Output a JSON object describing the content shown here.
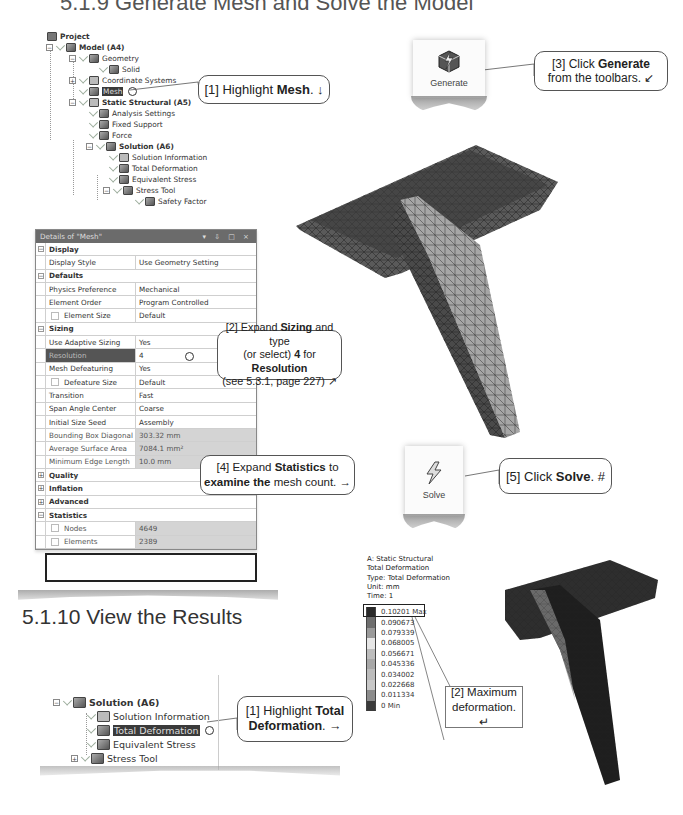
{
  "page_heading_partial": "5.1.9 Generate Mesh and Solve the Model",
  "tree": {
    "items": [
      {
        "label": "Project",
        "bold": true
      },
      {
        "label": "Model (A4)",
        "bold": true
      },
      {
        "label": "Geometry"
      },
      {
        "label": "Solid"
      },
      {
        "label": "Coordinate Systems"
      },
      {
        "label": "Mesh",
        "selected": true
      },
      {
        "label": "Static Structural (A5)",
        "bold": true
      },
      {
        "label": "Analysis Settings"
      },
      {
        "label": "Fixed Support"
      },
      {
        "label": "Force"
      },
      {
        "label": "Solution (A6)",
        "bold": true
      },
      {
        "label": "Solution Information"
      },
      {
        "label": "Total Deformation"
      },
      {
        "label": "Equivalent Stress"
      },
      {
        "label": "Stress Tool"
      },
      {
        "label": "Safety Factor"
      }
    ]
  },
  "callouts": {
    "c1": {
      "prefix": "[1] Highlight ",
      "bold": "Mesh",
      "suffix": ". ↓"
    },
    "c2": {
      "line1_pre": "[2] Expand ",
      "line1_bold": "Sizing",
      "line1_post": " and type",
      "line2_pre": "(or select) ",
      "line2_bold1": "4",
      "line2_mid": " for ",
      "line2_bold2": "Resolution",
      "line3": "(see 5.3.1, page 227) ↗"
    },
    "c3": {
      "line1_pre": "[3] Click ",
      "line1_bold": "Generate",
      "line2": "from the toolbars. ↙"
    },
    "c4": {
      "line1_pre": "[4] Expand ",
      "line1_bold": "Statistics",
      "line1_post": " to",
      "line2_bold": "examine the",
      "line2_post": " mesh count. →"
    },
    "c5": {
      "prefix": "[5] Click ",
      "bold": "Solve",
      "suffix": ". #"
    },
    "r1": {
      "line1_pre": "[1] Highlight ",
      "line1_bold": "Total",
      "line2_bold": "Deformation",
      "line2_post": ". →"
    },
    "r2": {
      "line1": "[2] Maximum",
      "line2": "deformation. ↵"
    }
  },
  "toolbar": {
    "generate_label": "Generate",
    "solve_label": "Solve"
  },
  "details": {
    "title": "Details of \"Mesh\"",
    "title_controls": "▾ ⇩ □ ×",
    "rows": [
      {
        "type": "group",
        "key": "Display",
        "toggle": "−"
      },
      {
        "key": "Display Style",
        "value": "Use Geometry Setting"
      },
      {
        "type": "group",
        "key": "Defaults",
        "toggle": "−"
      },
      {
        "key": "Physics Preference",
        "value": "Mechanical"
      },
      {
        "key": "Element Order",
        "value": "Program Controlled"
      },
      {
        "key": "Element Size",
        "value": "Default",
        "checkbox": true
      },
      {
        "type": "group",
        "key": "Sizing",
        "toggle": "−"
      },
      {
        "key": "Use Adaptive Sizing",
        "value": "Yes"
      },
      {
        "key": "Resolution",
        "value": "4",
        "selected": true
      },
      {
        "key": "Mesh Defeaturing",
        "value": "Yes"
      },
      {
        "key": "Defeature Size",
        "value": "Default",
        "checkbox": true
      },
      {
        "key": "Transition",
        "value": "Fast"
      },
      {
        "key": "Span Angle Center",
        "value": "Coarse"
      },
      {
        "key": "Initial Size Seed",
        "value": "Assembly"
      },
      {
        "key": "Bounding Box Diagonal",
        "value": "303.32 mm",
        "readonly": true
      },
      {
        "key": "Average Surface Area",
        "value": "7084.1 mm²",
        "readonly": true
      },
      {
        "key": "Minimum Edge Length",
        "value": "10.0 mm",
        "readonly": true
      },
      {
        "type": "group",
        "key": "Quality",
        "toggle": "+"
      },
      {
        "type": "group",
        "key": "Inflation",
        "toggle": "+"
      },
      {
        "type": "group",
        "key": "Advanced",
        "toggle": "+"
      },
      {
        "type": "group",
        "key": "Statistics",
        "toggle": "−"
      },
      {
        "key": "Nodes",
        "value": "4649",
        "checkbox": true,
        "readonly": true
      },
      {
        "key": "Elements",
        "value": "2389",
        "checkbox": true,
        "readonly": true
      }
    ]
  },
  "section": {
    "heading": "5.1.10 View the Results"
  },
  "results_tree": {
    "items": [
      {
        "label": "Solution (A6)",
        "bold": true
      },
      {
        "label": "Solution Information"
      },
      {
        "label": "Total Deformation",
        "selected": true
      },
      {
        "label": "Equivalent Stress"
      },
      {
        "label": "Stress Tool"
      }
    ]
  },
  "legend": {
    "header": [
      "A: Static Structural",
      "Total Deformation",
      "Type: Total Deformation",
      "Unit: mm",
      "Time: 1"
    ],
    "levels": [
      {
        "value": "0.10201 Max",
        "color": "#2a2a2a"
      },
      {
        "value": "0.090673",
        "color": "#6e6e6e"
      },
      {
        "value": "0.079339",
        "color": "#9a9a9a"
      },
      {
        "value": "0.068005",
        "color": "#e6e6e6"
      },
      {
        "value": "0.056671",
        "color": "#bdbdbd"
      },
      {
        "value": "0.045336",
        "color": "#a8a8a8"
      },
      {
        "value": "0.034002",
        "color": "#bcbcbc"
      },
      {
        "value": "0.022668",
        "color": "#c8c8c8"
      },
      {
        "value": "0.011334",
        "color": "#8c8c8c"
      },
      {
        "value": "0 Min",
        "color": "#3a3a3a"
      }
    ]
  }
}
